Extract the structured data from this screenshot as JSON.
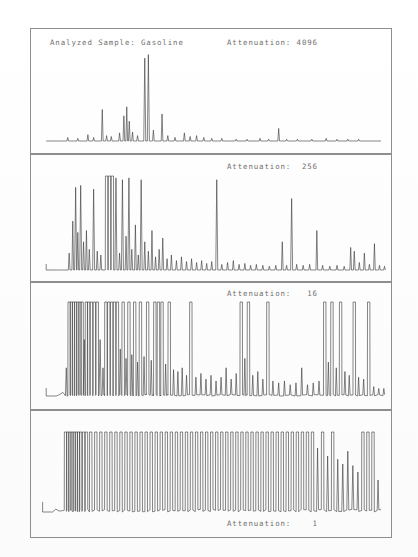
{
  "document": {
    "title": "Gas Chromatogram - Analyzed Sample: Gasoline",
    "sample_label": "Analyzed Sample: Gasoline",
    "line_color": "#3a3a3a",
    "frame_color": "#8e8e8e",
    "text_color": "#6f6f6f",
    "background": "#ffffff"
  },
  "panels": [
    {
      "id": "panel-1",
      "sample_label": "Analyzed Sample: Gasoline",
      "attenuation_label": "Attenuation: 4096",
      "attenuation_value": 4096,
      "label_position": "top"
    },
    {
      "id": "panel-2",
      "attenuation_label": "Attenuation:  256",
      "attenuation_value": 256,
      "label_position": "top"
    },
    {
      "id": "panel-3",
      "attenuation_label": "Attenuation:   16",
      "attenuation_value": 16,
      "label_position": "top"
    },
    {
      "id": "panel-4",
      "attenuation_label": "Attenuation:    1",
      "attenuation_value": 1,
      "label_position": "bottom"
    }
  ],
  "chart_data": {
    "type": "line",
    "title": "Analyzed Sample: Gasoline",
    "xlabel": "",
    "ylabel": "",
    "grid": false,
    "legend": "none",
    "x": "retention time (arbitrary units, 0-100 across panel width)",
    "y": "detector response (0 = baseline, 100 = full scale / clipped)",
    "series": [
      {
        "name": "Attenuation 4096",
        "panel": 1,
        "clip_level": 100,
        "baseline_start_x": 7,
        "peaks": [
          {
            "x": 10.2,
            "h": 4
          },
          {
            "x": 13.0,
            "h": 3
          },
          {
            "x": 15.8,
            "h": 7
          },
          {
            "x": 17.4,
            "h": 4
          },
          {
            "x": 19.8,
            "h": 35
          },
          {
            "x": 21.0,
            "h": 6
          },
          {
            "x": 22.3,
            "h": 5
          },
          {
            "x": 24.6,
            "h": 9
          },
          {
            "x": 25.8,
            "h": 28
          },
          {
            "x": 26.6,
            "h": 38
          },
          {
            "x": 27.3,
            "h": 22
          },
          {
            "x": 28.2,
            "h": 10
          },
          {
            "x": 29.6,
            "h": 6
          },
          {
            "x": 31.6,
            "h": 92
          },
          {
            "x": 32.6,
            "h": 96
          },
          {
            "x": 34.0,
            "h": 12
          },
          {
            "x": 36.4,
            "h": 30
          },
          {
            "x": 38.0,
            "h": 6
          },
          {
            "x": 40.0,
            "h": 4
          },
          {
            "x": 42.6,
            "h": 9
          },
          {
            "x": 44.2,
            "h": 5
          },
          {
            "x": 46.0,
            "h": 6
          },
          {
            "x": 48.0,
            "h": 4
          },
          {
            "x": 50.2,
            "h": 3
          },
          {
            "x": 53.0,
            "h": 3
          },
          {
            "x": 57.0,
            "h": 2
          },
          {
            "x": 60.0,
            "h": 2
          },
          {
            "x": 63.6,
            "h": 3
          },
          {
            "x": 66.0,
            "h": 2
          },
          {
            "x": 68.8,
            "h": 14
          },
          {
            "x": 71.0,
            "h": 2
          },
          {
            "x": 74.0,
            "h": 2
          },
          {
            "x": 78.0,
            "h": 2
          },
          {
            "x": 82.0,
            "h": 3
          },
          {
            "x": 85.0,
            "h": 2
          },
          {
            "x": 88.0,
            "h": 2
          },
          {
            "x": 91.0,
            "h": 2
          }
        ]
      },
      {
        "name": "Attenuation 256",
        "panel": 2,
        "clip_level": 100,
        "baseline_start_x": 7,
        "peaks": [
          {
            "x": 10.6,
            "h": 18
          },
          {
            "x": 11.6,
            "h": 52
          },
          {
            "x": 12.4,
            "h": 88
          },
          {
            "x": 13.0,
            "h": 40
          },
          {
            "x": 13.8,
            "h": 90
          },
          {
            "x": 14.6,
            "h": 30
          },
          {
            "x": 15.4,
            "h": 42
          },
          {
            "x": 16.2,
            "h": 22
          },
          {
            "x": 17.4,
            "h": 86
          },
          {
            "x": 18.4,
            "h": 20
          },
          {
            "x": 19.4,
            "h": 16
          },
          {
            "x": 21.0,
            "h": 100
          },
          {
            "x": 21.8,
            "h": 100
          },
          {
            "x": 22.6,
            "h": 100
          },
          {
            "x": 23.6,
            "h": 98
          },
          {
            "x": 24.6,
            "h": 18
          },
          {
            "x": 25.4,
            "h": 96
          },
          {
            "x": 26.4,
            "h": 36
          },
          {
            "x": 27.2,
            "h": 98
          },
          {
            "x": 28.0,
            "h": 22
          },
          {
            "x": 29.0,
            "h": 48
          },
          {
            "x": 29.8,
            "h": 16
          },
          {
            "x": 30.6,
            "h": 96
          },
          {
            "x": 31.6,
            "h": 30
          },
          {
            "x": 32.6,
            "h": 20
          },
          {
            "x": 33.6,
            "h": 42
          },
          {
            "x": 34.6,
            "h": 14
          },
          {
            "x": 35.6,
            "h": 22
          },
          {
            "x": 36.6,
            "h": 34
          },
          {
            "x": 37.8,
            "h": 12
          },
          {
            "x": 39.0,
            "h": 16
          },
          {
            "x": 40.4,
            "h": 10
          },
          {
            "x": 41.8,
            "h": 14
          },
          {
            "x": 43.2,
            "h": 9
          },
          {
            "x": 44.6,
            "h": 12
          },
          {
            "x": 46.0,
            "h": 8
          },
          {
            "x": 47.4,
            "h": 10
          },
          {
            "x": 48.8,
            "h": 7
          },
          {
            "x": 50.2,
            "h": 9
          },
          {
            "x": 51.6,
            "h": 96
          },
          {
            "x": 53.0,
            "h": 6
          },
          {
            "x": 54.6,
            "h": 8
          },
          {
            "x": 56.2,
            "h": 10
          },
          {
            "x": 57.8,
            "h": 6
          },
          {
            "x": 59.4,
            "h": 7
          },
          {
            "x": 61.0,
            "h": 5
          },
          {
            "x": 62.6,
            "h": 6
          },
          {
            "x": 64.4,
            "h": 5
          },
          {
            "x": 66.2,
            "h": 4
          },
          {
            "x": 68.0,
            "h": 5
          },
          {
            "x": 69.8,
            "h": 30
          },
          {
            "x": 71.0,
            "h": 5
          },
          {
            "x": 72.4,
            "h": 76
          },
          {
            "x": 73.8,
            "h": 6
          },
          {
            "x": 75.6,
            "h": 5
          },
          {
            "x": 77.4,
            "h": 6
          },
          {
            "x": 79.4,
            "h": 42
          },
          {
            "x": 81.0,
            "h": 5
          },
          {
            "x": 83.0,
            "h": 4
          },
          {
            "x": 85.0,
            "h": 5
          },
          {
            "x": 87.0,
            "h": 4
          },
          {
            "x": 88.8,
            "h": 24
          },
          {
            "x": 89.8,
            "h": 20
          },
          {
            "x": 91.2,
            "h": 8
          },
          {
            "x": 92.6,
            "h": 18
          },
          {
            "x": 94.0,
            "h": 6
          },
          {
            "x": 95.4,
            "h": 28
          },
          {
            "x": 96.8,
            "h": 5
          },
          {
            "x": 98.2,
            "h": 4
          }
        ]
      },
      {
        "name": "Attenuation 16",
        "panel": 3,
        "clip_level": 100,
        "baseline_start_x": 7,
        "noise_amplitude": 6,
        "peaks": [
          {
            "x": 9.8,
            "h": 30
          },
          {
            "x": 10.6,
            "h": 100
          },
          {
            "x": 11.2,
            "h": 100
          },
          {
            "x": 11.8,
            "h": 100
          },
          {
            "x": 12.4,
            "h": 100
          },
          {
            "x": 13.0,
            "h": 100
          },
          {
            "x": 13.6,
            "h": 100
          },
          {
            "x": 14.2,
            "h": 100
          },
          {
            "x": 14.8,
            "h": 60
          },
          {
            "x": 15.4,
            "h": 100
          },
          {
            "x": 16.0,
            "h": 100
          },
          {
            "x": 16.8,
            "h": 100
          },
          {
            "x": 17.6,
            "h": 100
          },
          {
            "x": 18.4,
            "h": 100
          },
          {
            "x": 19.2,
            "h": 60
          },
          {
            "x": 20.0,
            "h": 30
          },
          {
            "x": 20.8,
            "h": 100
          },
          {
            "x": 21.6,
            "h": 100
          },
          {
            "x": 22.4,
            "h": 100
          },
          {
            "x": 23.2,
            "h": 100
          },
          {
            "x": 24.0,
            "h": 100
          },
          {
            "x": 24.8,
            "h": 50
          },
          {
            "x": 25.6,
            "h": 100
          },
          {
            "x": 26.4,
            "h": 40
          },
          {
            "x": 27.2,
            "h": 100
          },
          {
            "x": 28.0,
            "h": 44
          },
          {
            "x": 28.8,
            "h": 100
          },
          {
            "x": 29.6,
            "h": 36
          },
          {
            "x": 30.4,
            "h": 100
          },
          {
            "x": 31.4,
            "h": 42
          },
          {
            "x": 32.4,
            "h": 100
          },
          {
            "x": 33.4,
            "h": 38
          },
          {
            "x": 34.4,
            "h": 100
          },
          {
            "x": 35.4,
            "h": 100
          },
          {
            "x": 36.4,
            "h": 100
          },
          {
            "x": 37.4,
            "h": 34
          },
          {
            "x": 38.4,
            "h": 100
          },
          {
            "x": 39.6,
            "h": 28
          },
          {
            "x": 40.8,
            "h": 26
          },
          {
            "x": 42.0,
            "h": 30
          },
          {
            "x": 43.2,
            "h": 22
          },
          {
            "x": 44.4,
            "h": 100
          },
          {
            "x": 45.8,
            "h": 20
          },
          {
            "x": 47.2,
            "h": 24
          },
          {
            "x": 48.6,
            "h": 18
          },
          {
            "x": 50.0,
            "h": 22
          },
          {
            "x": 51.4,
            "h": 16
          },
          {
            "x": 52.8,
            "h": 20
          },
          {
            "x": 54.2,
            "h": 30
          },
          {
            "x": 55.6,
            "h": 18
          },
          {
            "x": 57.0,
            "h": 24
          },
          {
            "x": 58.4,
            "h": 100
          },
          {
            "x": 59.4,
            "h": 40
          },
          {
            "x": 60.4,
            "h": 100
          },
          {
            "x": 61.6,
            "h": 22
          },
          {
            "x": 63.0,
            "h": 26
          },
          {
            "x": 64.4,
            "h": 18
          },
          {
            "x": 65.8,
            "h": 100
          },
          {
            "x": 67.2,
            "h": 16
          },
          {
            "x": 68.8,
            "h": 14
          },
          {
            "x": 70.4,
            "h": 16
          },
          {
            "x": 72.0,
            "h": 12
          },
          {
            "x": 73.6,
            "h": 14
          },
          {
            "x": 75.2,
            "h": 30
          },
          {
            "x": 76.8,
            "h": 12
          },
          {
            "x": 78.4,
            "h": 14
          },
          {
            "x": 80.0,
            "h": 16
          },
          {
            "x": 81.6,
            "h": 100
          },
          {
            "x": 82.6,
            "h": 36
          },
          {
            "x": 83.6,
            "h": 100
          },
          {
            "x": 84.8,
            "h": 30
          },
          {
            "x": 86.0,
            "h": 100
          },
          {
            "x": 87.2,
            "h": 26
          },
          {
            "x": 88.4,
            "h": 22
          },
          {
            "x": 89.8,
            "h": 100
          },
          {
            "x": 91.0,
            "h": 20
          },
          {
            "x": 92.4,
            "h": 18
          },
          {
            "x": 93.8,
            "h": 100
          },
          {
            "x": 95.2,
            "h": 10
          },
          {
            "x": 96.6,
            "h": 8
          },
          {
            "x": 98.0,
            "h": 8
          }
        ]
      },
      {
        "name": "Attenuation 1",
        "panel": 4,
        "clip_level": 100,
        "baseline_start_x": 6,
        "noise_amplitude": 14,
        "peaks": [
          {
            "x": 9.6,
            "h": 100
          },
          {
            "x": 10.2,
            "h": 100
          },
          {
            "x": 10.8,
            "h": 100
          },
          {
            "x": 11.4,
            "h": 100
          },
          {
            "x": 12.0,
            "h": 100
          },
          {
            "x": 12.6,
            "h": 100
          },
          {
            "x": 13.2,
            "h": 100
          },
          {
            "x": 13.8,
            "h": 100
          },
          {
            "x": 14.6,
            "h": 100
          },
          {
            "x": 15.4,
            "h": 100
          },
          {
            "x": 16.6,
            "h": 100
          },
          {
            "x": 18.0,
            "h": 100
          },
          {
            "x": 19.4,
            "h": 100
          },
          {
            "x": 20.8,
            "h": 100
          },
          {
            "x": 22.2,
            "h": 100
          },
          {
            "x": 23.6,
            "h": 100
          },
          {
            "x": 25.0,
            "h": 100
          },
          {
            "x": 26.4,
            "h": 100
          },
          {
            "x": 27.8,
            "h": 100
          },
          {
            "x": 29.2,
            "h": 100
          },
          {
            "x": 30.6,
            "h": 100
          },
          {
            "x": 32.0,
            "h": 100
          },
          {
            "x": 33.4,
            "h": 100
          },
          {
            "x": 34.8,
            "h": 100
          },
          {
            "x": 36.2,
            "h": 100
          },
          {
            "x": 37.6,
            "h": 100
          },
          {
            "x": 39.0,
            "h": 100
          },
          {
            "x": 40.4,
            "h": 100
          },
          {
            "x": 41.8,
            "h": 100
          },
          {
            "x": 43.2,
            "h": 100
          },
          {
            "x": 44.6,
            "h": 100
          },
          {
            "x": 46.0,
            "h": 100
          },
          {
            "x": 47.4,
            "h": 100
          },
          {
            "x": 48.8,
            "h": 100
          },
          {
            "x": 50.2,
            "h": 100
          },
          {
            "x": 51.6,
            "h": 100
          },
          {
            "x": 53.0,
            "h": 100
          },
          {
            "x": 54.4,
            "h": 100
          },
          {
            "x": 55.8,
            "h": 100
          },
          {
            "x": 57.2,
            "h": 100
          },
          {
            "x": 58.6,
            "h": 100
          },
          {
            "x": 60.0,
            "h": 100
          },
          {
            "x": 61.4,
            "h": 100
          },
          {
            "x": 62.8,
            "h": 100
          },
          {
            "x": 64.2,
            "h": 100
          },
          {
            "x": 65.6,
            "h": 100
          },
          {
            "x": 67.0,
            "h": 100
          },
          {
            "x": 68.4,
            "h": 100
          },
          {
            "x": 69.8,
            "h": 100
          },
          {
            "x": 71.2,
            "h": 100
          },
          {
            "x": 72.6,
            "h": 100
          },
          {
            "x": 74.0,
            "h": 100
          },
          {
            "x": 75.4,
            "h": 100
          },
          {
            "x": 76.8,
            "h": 100
          },
          {
            "x": 78.2,
            "h": 100
          },
          {
            "x": 79.6,
            "h": 80
          },
          {
            "x": 81.0,
            "h": 100
          },
          {
            "x": 82.4,
            "h": 70
          },
          {
            "x": 83.8,
            "h": 100
          },
          {
            "x": 85.2,
            "h": 66
          },
          {
            "x": 86.6,
            "h": 60
          },
          {
            "x": 88.0,
            "h": 76
          },
          {
            "x": 89.4,
            "h": 58
          },
          {
            "x": 90.8,
            "h": 50
          },
          {
            "x": 92.2,
            "h": 100
          },
          {
            "x": 93.6,
            "h": 100
          },
          {
            "x": 95.0,
            "h": 100
          },
          {
            "x": 96.4,
            "h": 40
          }
        ]
      }
    ]
  }
}
